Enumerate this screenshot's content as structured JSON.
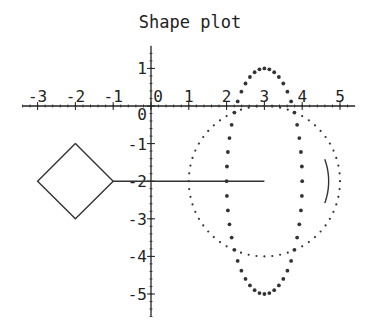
{
  "title": "Shape plot",
  "axes": {
    "x_ticks": [
      -3,
      -2,
      -1,
      0,
      1,
      2,
      3,
      4,
      5
    ],
    "y_ticks": [
      1,
      0,
      -1,
      -2,
      -3,
      -4,
      -5
    ],
    "xlim": [
      -3.4,
      5.4
    ],
    "ylim": [
      -5.6,
      1.6
    ]
  },
  "chart_data": {
    "type": "scatter",
    "title": "Shape plot",
    "xlabel": "",
    "ylabel": "",
    "xlim": [
      -3.4,
      5.4
    ],
    "ylim": [
      -5.6,
      1.6
    ],
    "grid": false,
    "x_tick_labels": [
      "-3",
      "-2",
      "-1",
      "0",
      "1",
      "2",
      "3",
      "4",
      "5"
    ],
    "y_tick_labels": [
      "1",
      "0",
      "-1",
      "-2",
      "-3",
      "-4",
      "-5"
    ],
    "series": [
      {
        "name": "diamond",
        "kind": "polygon",
        "points": [
          [
            -2,
            -1
          ],
          [
            -1,
            -2
          ],
          [
            -2,
            -3
          ],
          [
            -3,
            -2
          ],
          [
            -2,
            -1
          ]
        ]
      },
      {
        "name": "line",
        "kind": "line",
        "points": [
          [
            -1,
            -2
          ],
          [
            3,
            -2
          ]
        ]
      },
      {
        "name": "dotted-circle",
        "kind": "points",
        "center": [
          3,
          -2
        ],
        "rx": 2,
        "ry": 2,
        "count": 60
      },
      {
        "name": "dotted-ellipse",
        "kind": "points",
        "center": [
          3,
          -2
        ],
        "rx": 1,
        "ry": 3,
        "count": 48
      },
      {
        "name": "arc",
        "kind": "arc",
        "center": [
          3,
          -2
        ],
        "radius": 1.7,
        "start_deg": -20,
        "end_deg": 20
      }
    ]
  }
}
